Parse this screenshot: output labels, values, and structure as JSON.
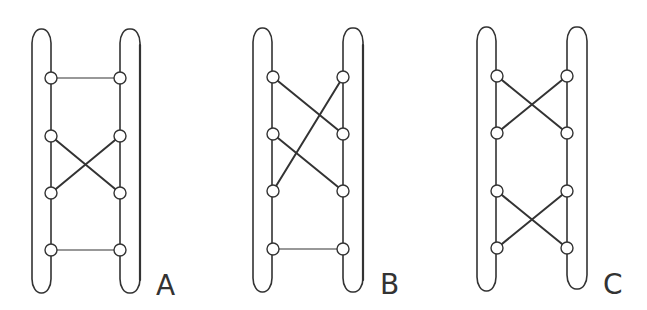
{
  "diagrams": [
    {
      "label": "A",
      "description": "Ladder with horizontal rung at top, crossed rungs between node rows 2 and 3, horizontal rung at bottom",
      "connections": [
        {
          "from": "L1",
          "to": "R1"
        },
        {
          "from": "L2",
          "to": "R3"
        },
        {
          "from": "R2",
          "to": "L3"
        },
        {
          "from": "L4",
          "to": "R4"
        }
      ]
    },
    {
      "label": "B",
      "description": "Ladder with two long crossing links spanning two rows, horizontal rung at bottom",
      "connections": [
        {
          "from": "L1",
          "to": "R2"
        },
        {
          "from": "R1",
          "to": "L3"
        },
        {
          "from": "L2",
          "to": "R3"
        },
        {
          "from": "L4",
          "to": "R4"
        }
      ]
    },
    {
      "label": "C",
      "description": "Ladder with two crossed pairs: rows 1-2 and rows 3-4",
      "connections": [
        {
          "from": "L1",
          "to": "R2"
        },
        {
          "from": "R1",
          "to": "L2"
        },
        {
          "from": "L3",
          "to": "R4"
        },
        {
          "from": "R3",
          "to": "L4"
        }
      ]
    }
  ],
  "colors": {
    "stroke": "#333333",
    "background": "#ffffff",
    "node_fill": "#ffffff"
  }
}
